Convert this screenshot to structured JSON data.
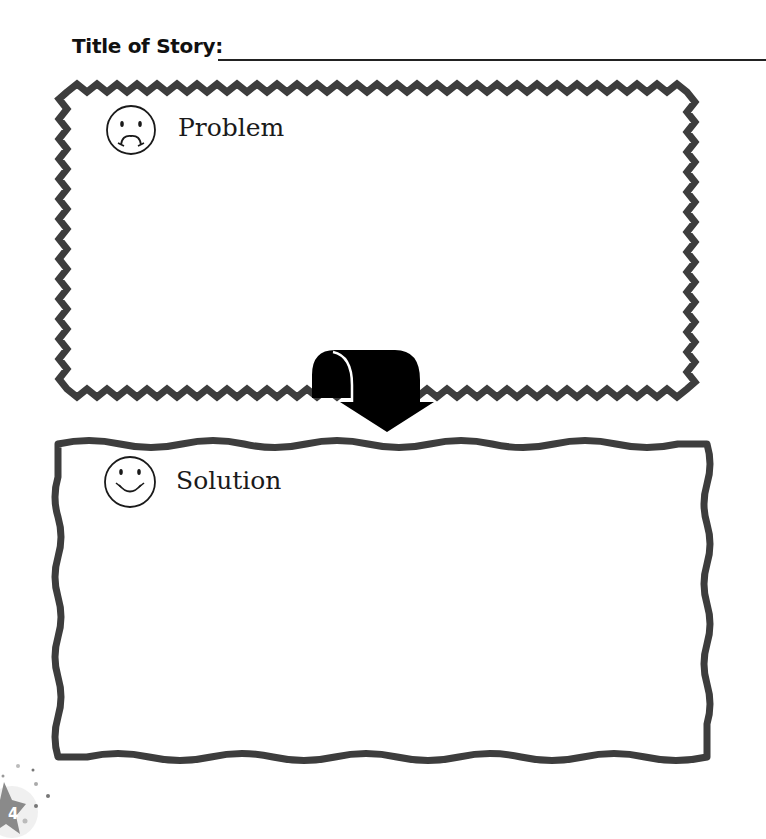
{
  "title": {
    "label": "Title of Story:",
    "value": ""
  },
  "problem_box": {
    "label": "Problem",
    "icon": "sad-face-icon",
    "border_style": "zigzag",
    "content": ""
  },
  "solution_box": {
    "label": "Solution",
    "icon": "happy-face-icon",
    "border_style": "wavy",
    "content": ""
  },
  "connector": {
    "icon": "curved-down-arrow-icon"
  },
  "page": {
    "number": "4",
    "badge_icon": "star-icon"
  },
  "colors": {
    "border": "#3d3d3d",
    "ink": "#111111",
    "arrow": "#000000",
    "badge": "#8a8a8a"
  }
}
